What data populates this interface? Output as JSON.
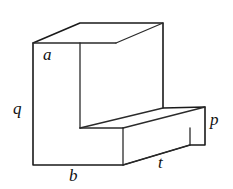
{
  "figure": {
    "name": "l-shaped-solid",
    "background_color": "#ffffff",
    "line_color": "#1a1a1a",
    "label_color": "#111111",
    "width_px": 233,
    "height_px": 189
  },
  "labels": {
    "a": "a",
    "q": "q",
    "b": "b",
    "t": "t",
    "p": "p"
  },
  "label_positions": {
    "a": "top face, near front-left corner of the tall upright block",
    "q": "left vertical edge, height of the tall upright block",
    "b": "bottom front edge, width of the upright block base",
    "t": "bottom front edge of the horizontal slab extending to the right",
    "p": "right end face of the horizontal slab, its height"
  },
  "geometry": {
    "projection": "oblique",
    "depth_offset": {
      "dx": 47,
      "dy": -20
    },
    "vertices": {
      "upright_front_top_left": [
        33,
        43
      ],
      "upright_front_top_right": [
        80,
        43
      ],
      "upright_back_top_left": [
        80,
        23
      ],
      "upright_back_top_right": [
        163,
        23
      ],
      "upright_front_bottom_left": [
        33,
        165
      ],
      "notch_inner_corner": [
        80,
        128
      ],
      "upright_back_right_low": [
        163,
        108
      ],
      "slab_front_top_left": [
        80,
        128
      ],
      "slab_front_top_right": [
        123,
        128
      ],
      "slab_back_top_right": [
        205,
        107
      ],
      "slab_front_bottom_left": [
        123,
        165
      ],
      "slab_front_bottom_right": [
        190,
        145
      ],
      "slab_back_bottom_right": [
        205,
        145
      ],
      "base_front_bottom_right": [
        123,
        165
      ]
    }
  }
}
